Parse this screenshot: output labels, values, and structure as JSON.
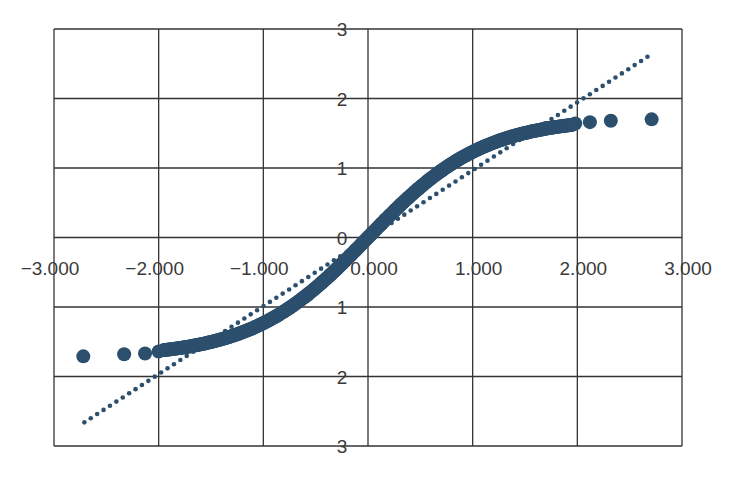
{
  "chart_data": {
    "type": "scatter",
    "title": "",
    "xlabel": "",
    "ylabel": "",
    "xlim": [
      -3,
      3
    ],
    "ylim": [
      -3,
      3
    ],
    "grid": true,
    "legend": null,
    "x_ticks": [
      -3,
      -2,
      -1,
      0,
      1,
      2,
      3
    ],
    "x_tick_labels": [
      "−3.000",
      "−2.000",
      "−1.000",
      "0.000",
      "1.000",
      "2.000",
      "3.000"
    ],
    "y_ticks": [
      3,
      2,
      1,
      0,
      -1,
      -2,
      -3
    ],
    "y_tick_labels": [
      "3",
      "2",
      "1",
      "0",
      "1",
      "2",
      "3"
    ],
    "colors": {
      "points": "#2c4f6e",
      "reference_line": "#2c4f6e",
      "grid": "#333333",
      "text": "#3a3a3a"
    },
    "series": [
      {
        "name": "sample quantiles",
        "kind": "scatter",
        "description": "Dense S-shaped band approximately y = 1.72*tanh(0.9*x); sparse tail points listed explicitly",
        "curve_model": {
          "amplitude": 1.72,
          "k": 0.9,
          "x_from": -1.95,
          "x_to": 1.95
        },
        "tail_points": [
          {
            "x": -2.72,
            "y": -1.71
          },
          {
            "x": -2.33,
            "y": -1.68
          },
          {
            "x": -2.13,
            "y": -1.67
          },
          {
            "x": -2.0,
            "y": -1.64
          },
          {
            "x": 1.98,
            "y": 1.64
          },
          {
            "x": 2.12,
            "y": 1.66
          },
          {
            "x": 2.32,
            "y": 1.68
          },
          {
            "x": 2.71,
            "y": 1.7
          }
        ],
        "key_points": [
          {
            "x": -1.0,
            "y": -1.22
          },
          {
            "x": 0.0,
            "y": 0.0
          },
          {
            "x": 1.0,
            "y": 1.22
          }
        ]
      },
      {
        "name": "reference line",
        "kind": "dotted-line",
        "start": {
          "x": -2.71,
          "y": -2.66
        },
        "end": {
          "x": 2.67,
          "y": 2.6
        }
      }
    ]
  }
}
